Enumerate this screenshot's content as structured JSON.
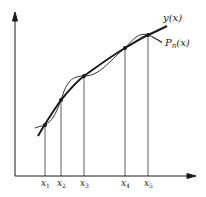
{
  "figure": {
    "curve_label": "y(x)",
    "poly_label_main": "P",
    "poly_label_sub": "n",
    "poly_label_arg": "(x)",
    "ticks": [
      {
        "base": "x",
        "sub": "1"
      },
      {
        "base": "x",
        "sub": "2"
      },
      {
        "base": "x",
        "sub": "3"
      },
      {
        "base": "x",
        "sub": "4"
      },
      {
        "base": "x",
        "sub": "5"
      }
    ]
  },
  "colors": {
    "ink": "#1a1a1a",
    "background": "#ffffff"
  }
}
